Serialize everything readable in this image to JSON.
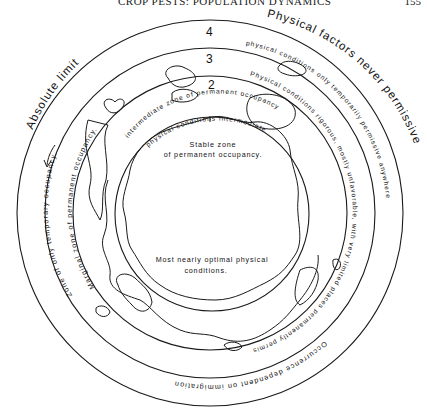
{
  "header": {
    "running_title": "CROP PESTS: POPULATION DYNAMICS",
    "page_number": "155"
  },
  "diagram": {
    "zone_numbers": [
      "4",
      "3",
      "2"
    ],
    "outer_labels": {
      "absolute_limit": "Absolute limit",
      "physical_factors": "Physical factors never permissive"
    },
    "zone3": {
      "left": "Zone of only temporary occupancy.",
      "right": "physical conditions only temporarily permissive anywhere",
      "bottom": "Occurrence dependent on immigration"
    },
    "zone2_outer_band": {
      "left": "Marginal zone of permanent occupancy.",
      "right": "Physical conditions rigorous, mostly unfavorable, with very limited places permanently permissive"
    },
    "zone2_inner_band": {
      "line1": "intermediate zone of permanent occupancy",
      "line2": "physical conditions intermediate"
    },
    "zone1": {
      "top_line1": "Stable zone",
      "top_line2": "of permanent occupancy.",
      "bottom_line1": "Most nearly optimal physical",
      "bottom_line2": "conditions."
    }
  }
}
